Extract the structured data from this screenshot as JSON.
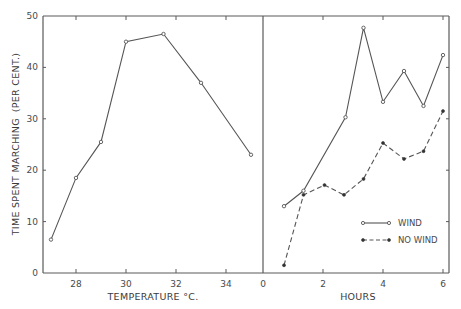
{
  "chart_data": [
    {
      "type": "line",
      "panel": "left",
      "title": "",
      "xlabel": "TEMPERATURE °C.",
      "ylabel": "TIME SPENT MARCHING (PER CENT.)",
      "xlim": [
        26.7,
        35.5
      ],
      "ylim": [
        0,
        50
      ],
      "xticks": [
        28,
        30,
        32,
        34
      ],
      "xtick_labels": [
        "28",
        "30",
        "32",
        "34"
      ],
      "yticks": [
        0,
        10,
        20,
        30,
        40,
        50
      ],
      "ytick_labels": [
        "0",
        "10",
        "20",
        "30",
        "40",
        "50"
      ],
      "grid": false,
      "series": [
        {
          "name": "Temperature response",
          "style": "solid",
          "marker": "open-circle",
          "x": [
            27.0,
            28.0,
            29.0,
            30.0,
            31.5,
            33.0,
            35.0
          ],
          "y": [
            6.5,
            18.5,
            25.5,
            45.0,
            46.5,
            37.0,
            23.0
          ]
        }
      ]
    },
    {
      "type": "line",
      "panel": "right",
      "title": "",
      "xlabel": "HOURS",
      "ylabel": "TIME SPENT MARCHING (PER CENT.)",
      "xlim": [
        0,
        6.2
      ],
      "ylim": [
        0,
        50
      ],
      "xticks": [
        0,
        2,
        4,
        6
      ],
      "xtick_labels": [
        "0",
        "2",
        "4",
        "6"
      ],
      "yticks": [
        0,
        10,
        20,
        30,
        40,
        50
      ],
      "grid": false,
      "legend_position": "lower right",
      "series": [
        {
          "name": "WIND",
          "style": "solid",
          "marker": "open-circle",
          "x": [
            0.7,
            1.35,
            2.75,
            3.35,
            4.0,
            4.7,
            5.35,
            6.0
          ],
          "y": [
            13.0,
            16.0,
            30.3,
            47.7,
            33.3,
            39.3,
            32.5,
            42.4
          ]
        },
        {
          "name": "NO WIND",
          "style": "dashed",
          "marker": "filled-dot",
          "x": [
            0.7,
            1.35,
            2.05,
            2.7,
            3.35,
            4.0,
            4.7,
            5.35,
            6.0
          ],
          "y": [
            1.5,
            15.2,
            17.1,
            15.2,
            18.3,
            25.3,
            22.2,
            23.7,
            31.5
          ]
        }
      ]
    }
  ],
  "labels": {
    "y_axis_title": "TIME SPENT MARCHING",
    "y_axis_unit": "(PER CENT.)",
    "left_x_title": "TEMPERATURE °C.",
    "right_x_title": "HOURS",
    "legend_wind": "WIND",
    "legend_no_wind": "NO WIND"
  },
  "colors": {
    "line": "#555555",
    "axis": "#5a5a5a",
    "text": "#4a4a4a",
    "background": "#ffffff"
  }
}
